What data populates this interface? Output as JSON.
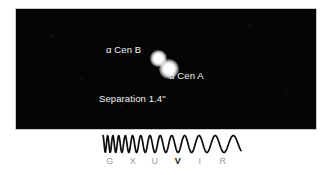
{
  "figure": {
    "sky": {
      "background_color": "#050505",
      "stars": [
        {
          "name": "alpha-cen-a",
          "label": "α Cen A",
          "relative_size": "large"
        },
        {
          "name": "alpha-cen-b",
          "label": "α Cen B",
          "relative_size": "small"
        }
      ],
      "labels": {
        "alpha_cen_b": "α Cen B",
        "alpha_cen_a": "α Cen A",
        "separation": "Separation 1.4\""
      }
    },
    "spectrum": {
      "wave_description": "chirped sinusoid, wavelength increasing left to right",
      "highlighted_band": "V",
      "bands": [
        {
          "letter": "G",
          "x": 94,
          "highlighted": false
        },
        {
          "letter": "X",
          "x": 117,
          "highlighted": false
        },
        {
          "letter": "U",
          "x": 139,
          "highlighted": false
        },
        {
          "letter": "V",
          "x": 162,
          "highlighted": true
        },
        {
          "letter": "I",
          "x": 184,
          "highlighted": false
        },
        {
          "letter": "R",
          "x": 207,
          "highlighted": false
        }
      ],
      "label_color": "#9b9b9b",
      "highlight_color": "#1a1a1a",
      "wave_color": "#0d0d0d"
    }
  }
}
